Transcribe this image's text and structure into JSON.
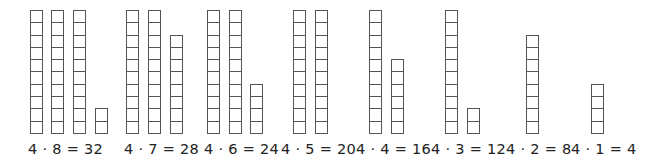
{
  "unit_height": 12.3,
  "baseline_y": 133,
  "groups": [
    {
      "label": "4 · 8 = 32",
      "label_x": 28,
      "columns": [
        {
          "x": 30,
          "cells": 10
        },
        {
          "x": 51,
          "cells": 10
        },
        {
          "x": 73,
          "cells": 10
        },
        {
          "x": 95,
          "cells": 2
        }
      ]
    },
    {
      "label": "4 · 7 = 28",
      "label_x": 124,
      "columns": [
        {
          "x": 126,
          "cells": 10
        },
        {
          "x": 148,
          "cells": 10
        },
        {
          "x": 170,
          "cells": 8
        }
      ]
    },
    {
      "label": "4 · 6 = 24",
      "label_x": 204,
      "columns": [
        {
          "x": 207,
          "cells": 10
        },
        {
          "x": 229,
          "cells": 10
        },
        {
          "x": 250,
          "cells": 4
        }
      ]
    },
    {
      "label": "4 · 5 = 20",
      "label_x": 281,
      "columns": [
        {
          "x": 293,
          "cells": 10
        },
        {
          "x": 315,
          "cells": 10
        }
      ]
    },
    {
      "label": "4 · 4 = 16",
      "label_x": 356,
      "columns": [
        {
          "x": 369,
          "cells": 10
        },
        {
          "x": 391,
          "cells": 6
        }
      ]
    },
    {
      "label": "4 · 3 = 12",
      "label_x": 431,
      "columns": [
        {
          "x": 445,
          "cells": 10
        },
        {
          "x": 467,
          "cells": 2
        }
      ]
    },
    {
      "label": "4 · 2 = 8",
      "label_x": 506,
      "columns": [
        {
          "x": 526,
          "cells": 8
        }
      ]
    },
    {
      "label": "4 · 1 = 4",
      "label_x": 571,
      "columns": [
        {
          "x": 591,
          "cells": 4
        }
      ]
    }
  ]
}
